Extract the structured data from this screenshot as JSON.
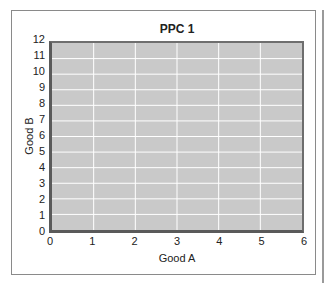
{
  "chart_data": {
    "type": "line",
    "title": "PPC 1",
    "xlabel": "Good A",
    "ylabel": "Good B",
    "x_ticks": [
      "0",
      "1",
      "2",
      "3",
      "4",
      "5",
      "6"
    ],
    "y_ticks": [
      "0",
      "1",
      "2",
      "3",
      "4",
      "5",
      "6",
      "7",
      "8",
      "9",
      "10",
      "11",
      "12"
    ],
    "xlim": [
      0,
      6
    ],
    "ylim": [
      0,
      12
    ],
    "grid": true,
    "series": [],
    "colors": {
      "plot_bg": "#c9c9c9",
      "grid": "#ffffff",
      "axis": "#5a5a5a"
    }
  }
}
